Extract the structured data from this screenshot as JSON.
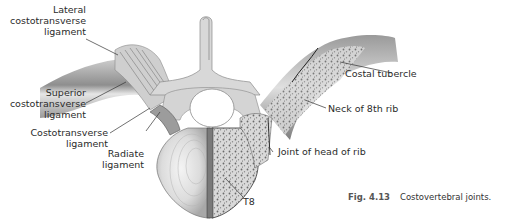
{
  "figure": {
    "number": "Fig. 4.13",
    "title": "Costovertebral joints."
  },
  "labels": {
    "lateral_costotransverse": [
      "Lateral",
      "costotransverse",
      "ligament"
    ],
    "superior_costotransverse": [
      "Superior",
      "costotransverse",
      "ligament"
    ],
    "costotransverse": [
      "Costotransverse",
      "ligament"
    ],
    "radiate": [
      "Radiate",
      "ligament"
    ],
    "costal_tubercle": "Costal tubercle",
    "neck_8th_rib": "Neck of 8th rib",
    "joint_head_rib": "Joint of head of rib",
    "vertebra": "T8"
  },
  "colors": {
    "bone_light": "#e8e8e8",
    "bone_mid": "#bdbdbd",
    "bone_dark": "#6f6f6f",
    "leader": "#333333",
    "text": "#2b2b2b"
  }
}
